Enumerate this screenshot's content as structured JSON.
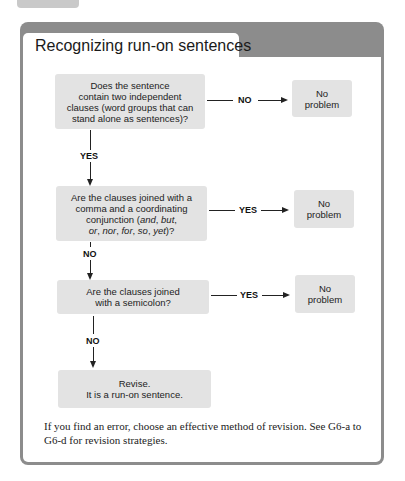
{
  "title": "Recognizing run-on sentences",
  "flowchart": {
    "q1": "Does the sentence contain two independent clauses (word groups that can stand alone as sentences)?",
    "q1_lines": [
      "Does the sentence",
      "contain two independent",
      "clauses (word groups that can",
      "stand alone as sentences)?"
    ],
    "q1_no_label": "NO",
    "q1_yes_label": "YES",
    "q2_lines": [
      "Are the clauses joined with a",
      "comma and a coordinating"
    ],
    "q2_line3_prefix": "conjunction (",
    "q2_line3_and": "and",
    "q2_line3_sep": ", ",
    "q2_line3_but": "but",
    "q2_line3_suffix": ",",
    "q2_line4": {
      "or": "or",
      "nor": "nor",
      "for": "for",
      "so": "so",
      "yet": "yet",
      "end": ")?"
    },
    "q2_yes_label": "YES",
    "q2_no_label": "NO",
    "q3_lines": [
      "Are the clauses joined",
      "with a semicolon?"
    ],
    "q3_yes_label": "YES",
    "q3_no_label": "NO",
    "result_lines": [
      "Revise.",
      "It is a run-on sentence."
    ],
    "no_problem_lines": [
      "No",
      "problem"
    ]
  },
  "footer_text": "If you find an error, choose an effective method of revision. See G6-a to G6-d for revision strategies.",
  "colors": {
    "frame": "#8c8c8c",
    "box": "#e3e3e3",
    "tab": "#c9c9c9"
  }
}
